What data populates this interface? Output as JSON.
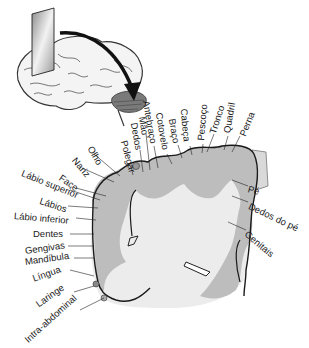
{
  "diagram": {
    "type": "somatosensory homunculus cortex cross-section",
    "colors": {
      "cortex_gray": "#bdbdbd",
      "white_matter": "#ececec",
      "outline": "#1a1a1a",
      "slab": "#d9d9d9"
    },
    "labels": {
      "top": [
        {
          "text": "Polegar",
          "x": 128,
          "y": 163,
          "angle": -75
        },
        {
          "text": "Dedos",
          "x": 137,
          "y": 146,
          "angle": -80
        },
        {
          "text": "Mão",
          "x": 143,
          "y": 131,
          "angle": -80
        },
        {
          "text": "Antebraço",
          "x": 150,
          "y": 142,
          "angle": -80
        },
        {
          "text": "Cotovelo",
          "x": 163,
          "y": 150,
          "angle": -80
        },
        {
          "text": "Braço",
          "x": 175,
          "y": 142,
          "angle": -80
        },
        {
          "text": "Cabeça",
          "x": 187,
          "y": 142,
          "angle": -85
        },
        {
          "text": "Pescoço",
          "x": 200,
          "y": 140,
          "angle": -85
        },
        {
          "text": "Tronco",
          "x": 212,
          "y": 132,
          "angle": -75
        },
        {
          "text": "Quadril",
          "x": 226,
          "y": 132,
          "angle": -80
        },
        {
          "text": "Perna",
          "x": 238,
          "y": 132,
          "angle": -70
        }
      ],
      "left": [
        {
          "text": "Olho",
          "x": 92,
          "y": 152,
          "angle": 60
        },
        {
          "text": "Nariz",
          "x": 76,
          "y": 160,
          "angle": 50
        },
        {
          "text": "Face",
          "x": 62,
          "y": 176,
          "angle": 35
        },
        {
          "text": "Lábio superior",
          "x": 22,
          "y": 172,
          "angle": 22
        },
        {
          "text": "Lábios",
          "x": 40,
          "y": 200,
          "angle": 18
        },
        {
          "text": "Lábio inferior",
          "x": 14,
          "y": 216,
          "angle": 5
        },
        {
          "text": "Dentes",
          "x": 33,
          "y": 234,
          "angle": 0
        },
        {
          "text": "Gengivas",
          "x": 25,
          "y": 250,
          "angle": -8
        },
        {
          "text": "Mandíbula",
          "x": 25,
          "y": 261,
          "angle": -8
        },
        {
          "text": "Língua",
          "x": 33,
          "y": 277,
          "angle": -20
        },
        {
          "text": "Laringe",
          "x": 37,
          "y": 301,
          "angle": -35
        },
        {
          "text": "Intra-abdominal",
          "x": 26,
          "y": 336,
          "angle": -42
        }
      ],
      "right": [
        {
          "text": "Pé",
          "x": 248,
          "y": 188,
          "angle": 15
        },
        {
          "text": "Dedos do pé",
          "x": 249,
          "y": 205,
          "angle": 25
        },
        {
          "text": "Genitais",
          "x": 246,
          "y": 232,
          "angle": 40
        }
      ]
    }
  }
}
